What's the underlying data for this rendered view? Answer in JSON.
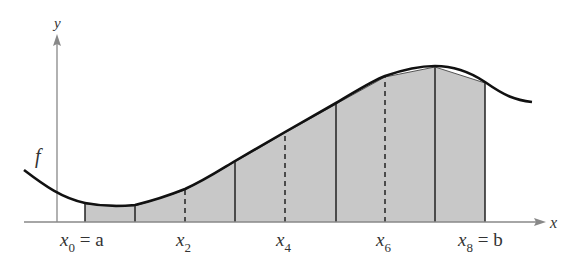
{
  "figure": {
    "axes": {
      "x_label": "x",
      "y_label": "y"
    },
    "function_label": "f",
    "tick_labels": [
      {
        "main": "x",
        "sub": "0",
        "suffix": " = a"
      },
      {
        "main": "x",
        "sub": "2",
        "suffix": ""
      },
      {
        "main": "x",
        "sub": "4",
        "suffix": ""
      },
      {
        "main": "x",
        "sub": "6",
        "suffix": ""
      },
      {
        "main": "x",
        "sub": "8",
        "suffix": " = b"
      }
    ],
    "subintervals": 8,
    "colors": {
      "fill": "#c8c8c8",
      "curve": "#111111",
      "axis": "#888888",
      "edge": "#222222"
    }
  }
}
